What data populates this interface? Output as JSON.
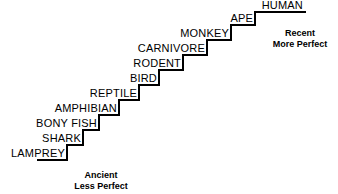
{
  "diagram": {
    "line_color": "#000000",
    "background_color": "#ffffff",
    "text_color": "#000000"
  },
  "steps": [
    {
      "label": "LAMPREY",
      "index": 1,
      "riser_x": 67,
      "tread_y": 160
    },
    {
      "label": "SHARK",
      "index": 2,
      "riser_x": 83,
      "tread_y": 145
    },
    {
      "label": "BONY FISH",
      "index": 3,
      "riser_x": 99,
      "tread_y": 130
    },
    {
      "label": "AMPHIBIAN",
      "index": 4,
      "riser_x": 119,
      "tread_y": 115
    },
    {
      "label": "REPTILE",
      "index": 5,
      "riser_x": 139,
      "tread_y": 100
    },
    {
      "label": "BIRD",
      "index": 6,
      "riser_x": 159,
      "tread_y": 85
    },
    {
      "label": "RODENT",
      "index": 7,
      "riser_x": 183,
      "tread_y": 70
    },
    {
      "label": "CARNIVORE",
      "index": 8,
      "riser_x": 207,
      "tread_y": 55
    },
    {
      "label": "MONKEY",
      "index": 9,
      "riser_x": 231,
      "tread_y": 40
    },
    {
      "label": "APE",
      "index": 10,
      "riser_x": 255,
      "tread_y": 25
    },
    {
      "label": "HUMAN",
      "index": 11,
      "riser_x": 279,
      "tread_y": 12
    }
  ],
  "captions": {
    "left": {
      "line1": "Ancient",
      "line2": "Less Perfect"
    },
    "right": {
      "line1": "Recent",
      "line2": "More Perfect"
    }
  }
}
